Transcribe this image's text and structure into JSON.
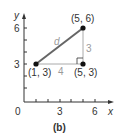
{
  "figure": {
    "caption": "(b)",
    "axes": {
      "x_label": "x",
      "y_label": "y",
      "origin_label": "0",
      "x_ticks": [
        "3",
        "6"
      ],
      "y_ticks": [
        "3",
        "6"
      ]
    },
    "points": [
      {
        "label": "(1, 3)",
        "x": 1,
        "y": 3
      },
      {
        "label": "(5, 6)",
        "x": 5,
        "y": 6
      },
      {
        "label": "(5, 3)",
        "x": 5,
        "y": 3
      }
    ],
    "segments": {
      "hypotenuse_label": "d",
      "horizontal_label": "4",
      "vertical_label": "3"
    },
    "colors": {
      "axis": "#333333",
      "hypotenuse": "#666666",
      "legs": "#aaaaaa",
      "points": "#111111"
    }
  }
}
